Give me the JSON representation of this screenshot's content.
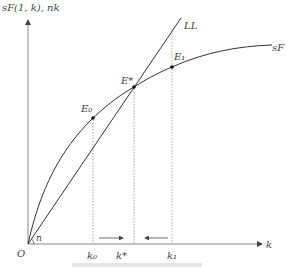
{
  "figure": {
    "y_axis_label": "sF(1, k), nk",
    "x_axis_label": "k",
    "origin_label": "O",
    "angle_label": "n",
    "line_label": "LL",
    "curve_label": "sF",
    "points": {
      "e0": "E₀",
      "estar": "E*",
      "e1": "E₁"
    },
    "ticks": {
      "k0": "k₀",
      "kstar": "k*",
      "k1": "k₁"
    },
    "colors": {
      "curve": "#333333",
      "axis": "#888888",
      "guide": "#aaaaaa"
    }
  }
}
